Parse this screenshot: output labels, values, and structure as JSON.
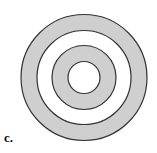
{
  "figure": {
    "label": "c.",
    "center": [
      84,
      77.5
    ],
    "rings": [
      {
        "name": "outer-ring",
        "r": 63,
        "fill": "#cfcfcf"
      },
      {
        "name": "second-ring",
        "r": 47,
        "fill": "#ffffff"
      },
      {
        "name": "third-ring",
        "r": 32,
        "fill": "#cfcfcf"
      },
      {
        "name": "inner-circle",
        "r": 16,
        "fill": "#ffffff"
      }
    ],
    "stroke": "#333333"
  }
}
